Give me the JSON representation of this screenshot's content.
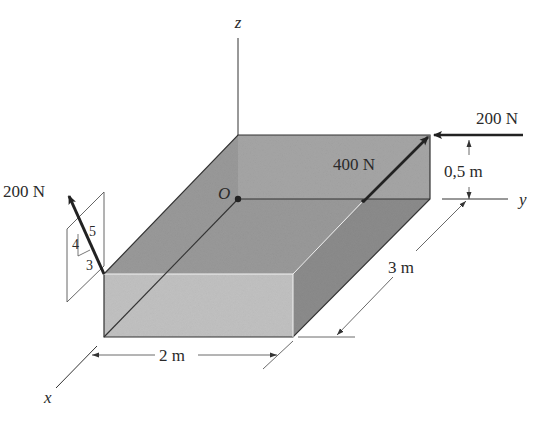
{
  "figure": {
    "axes": {
      "x": "x",
      "y": "y",
      "z": "z",
      "origin": "O"
    },
    "forces": [
      {
        "id": "force-left",
        "label": "200 N",
        "slope": {
          "vertical": "4",
          "horizontal": "3",
          "hypotenuse": "5"
        }
      },
      {
        "id": "force-diagonal",
        "label": "400 N"
      },
      {
        "id": "force-top-right",
        "label": "200 N"
      }
    ],
    "dimensions": {
      "width": "2 m",
      "depth": "3 m",
      "height": "0,5 m"
    }
  }
}
